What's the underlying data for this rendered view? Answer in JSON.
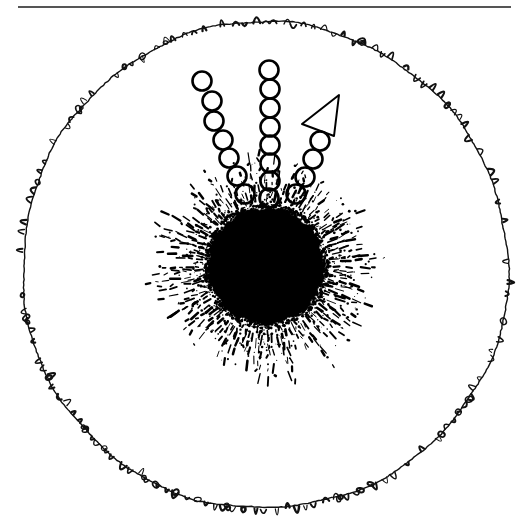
{
  "figure": {
    "title": "Scanned line drawing of a circular field with central dark body",
    "medium": "black-and-white line art",
    "background_color": "#ffffff",
    "ink_color": "#000000",
    "canvas": {
      "width": 530,
      "height": 527
    }
  },
  "top_rule": {
    "name": "horizontal-divider-rule",
    "x1": 18,
    "x2": 511,
    "y": 7,
    "thickness": 2,
    "color": "#555555"
  },
  "outer_boundary": {
    "name": "hand-drawn-outer-circle",
    "center_x": 265,
    "center_y": 266,
    "radius_x": 243,
    "radius_y": 243,
    "stroke_width": 1.4,
    "texture": "wavy scalloped hand-drawn loops",
    "color": "#111111",
    "scallop_count": 150
  },
  "central_body": {
    "name": "solid-black-disc",
    "center_x": 266,
    "center_y": 266,
    "radius": 58,
    "fill": "#000000",
    "edge": "ragged stippled margin"
  },
  "corona": {
    "name": "radiating-corona",
    "inner_radius": 60,
    "outer_radius": 118,
    "ray_count": 150,
    "style": "dashes and dots of varying length",
    "color": "#000000"
  },
  "circle_chains": [
    {
      "name": "left-circle-chain",
      "count": 7,
      "circle_radius": 9.5,
      "stroke_width": 2.6,
      "color": "#000000",
      "points": [
        {
          "x": 202,
          "y": 81
        },
        {
          "x": 212,
          "y": 101
        },
        {
          "x": 214,
          "y": 121
        },
        {
          "x": 223,
          "y": 140
        },
        {
          "x": 229,
          "y": 158
        },
        {
          "x": 237,
          "y": 176
        },
        {
          "x": 245,
          "y": 194
        }
      ]
    },
    {
      "name": "middle-circle-chain",
      "count": 8,
      "circle_radius": 9.5,
      "stroke_width": 2.6,
      "color": "#000000",
      "points": [
        {
          "x": 269,
          "y": 70
        },
        {
          "x": 270,
          "y": 89
        },
        {
          "x": 270,
          "y": 108
        },
        {
          "x": 270,
          "y": 127
        },
        {
          "x": 270,
          "y": 145
        },
        {
          "x": 270,
          "y": 163
        },
        {
          "x": 270,
          "y": 181
        },
        {
          "x": 269,
          "y": 198
        }
      ]
    },
    {
      "name": "right-circle-chain",
      "count": 4,
      "circle_radius": 9.5,
      "stroke_width": 2.6,
      "color": "#000000",
      "points": [
        {
          "x": 320,
          "y": 141
        },
        {
          "x": 313,
          "y": 159
        },
        {
          "x": 305,
          "y": 177
        },
        {
          "x": 296,
          "y": 194
        }
      ]
    }
  ],
  "arrow_marker": {
    "name": "left-pointing-arrowhead",
    "style": "outlined triangle",
    "stroke_width": 2.0,
    "color": "#000000",
    "vertices": [
      {
        "x": 302,
        "y": 124
      },
      {
        "x": 339,
        "y": 95
      },
      {
        "x": 334,
        "y": 136
      }
    ]
  },
  "labels": {
    "caption": "",
    "figure_number": ""
  }
}
